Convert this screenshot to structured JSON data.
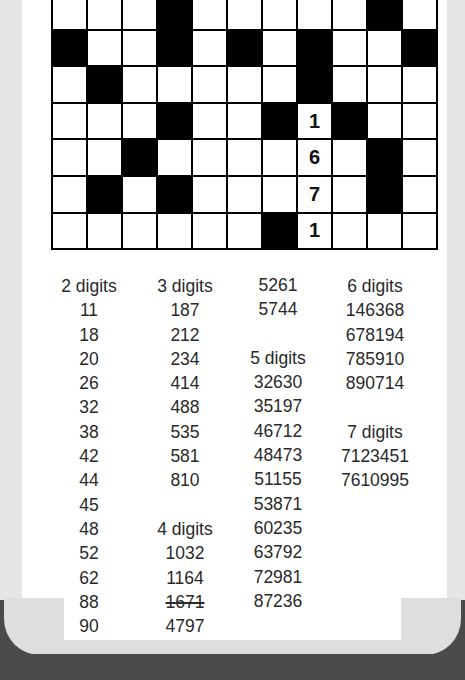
{
  "grid": {
    "cols": 11,
    "rows": 7,
    "cells": [
      [
        "w",
        "w",
        "w",
        "b",
        "w",
        "w",
        "w",
        "w",
        "w",
        "b",
        "w"
      ],
      [
        "b",
        "w",
        "w",
        "b",
        "w",
        "b",
        "w",
        "b",
        "w",
        "w",
        "b"
      ],
      [
        "w",
        "b",
        "w",
        "w",
        "w",
        "w",
        "w",
        "b",
        "w",
        "w",
        "w"
      ],
      [
        "w",
        "w",
        "w",
        "b",
        "w",
        "w",
        "b",
        "1",
        "b",
        "w",
        "w"
      ],
      [
        "w",
        "w",
        "b",
        "w",
        "w",
        "w",
        "w",
        "6",
        "w",
        "b",
        "w"
      ],
      [
        "w",
        "b",
        "w",
        "b",
        "w",
        "w",
        "w",
        "7",
        "w",
        "b",
        "w"
      ],
      [
        "w",
        "w",
        "w",
        "w",
        "w",
        "w",
        "b",
        "1",
        "w",
        "w",
        "w"
      ]
    ]
  },
  "lists": {
    "col1": [
      {
        "text": "2 digits",
        "type": "heading"
      },
      {
        "text": "11"
      },
      {
        "text": "18"
      },
      {
        "text": "20"
      },
      {
        "text": "26"
      },
      {
        "text": "32"
      },
      {
        "text": "38"
      },
      {
        "text": "42"
      },
      {
        "text": "44"
      },
      {
        "text": "45"
      },
      {
        "text": "48"
      },
      {
        "text": "52"
      },
      {
        "text": "62"
      },
      {
        "text": "88"
      },
      {
        "text": "90"
      }
    ],
    "col2": [
      {
        "text": "3 digits",
        "type": "heading"
      },
      {
        "text": "187"
      },
      {
        "text": "212"
      },
      {
        "text": "234"
      },
      {
        "text": "414"
      },
      {
        "text": "488"
      },
      {
        "text": "535"
      },
      {
        "text": "581"
      },
      {
        "text": "810"
      },
      {
        "text": ""
      },
      {
        "text": "4 digits",
        "type": "heading"
      },
      {
        "text": "1032"
      },
      {
        "text": "1164"
      },
      {
        "text": "1671",
        "struck": true
      },
      {
        "text": "4797"
      }
    ],
    "col3": [
      {
        "text": "5261"
      },
      {
        "text": "5744"
      },
      {
        "text": ""
      },
      {
        "text": "5 digits",
        "type": "heading"
      },
      {
        "text": "32630"
      },
      {
        "text": "35197"
      },
      {
        "text": "46712"
      },
      {
        "text": "48473"
      },
      {
        "text": "51155"
      },
      {
        "text": "53871"
      },
      {
        "text": "60235"
      },
      {
        "text": "63792"
      },
      {
        "text": "72981"
      },
      {
        "text": "87236"
      }
    ],
    "col4": [
      {
        "text": "6 digits",
        "type": "heading"
      },
      {
        "text": "146368"
      },
      {
        "text": "678194"
      },
      {
        "text": "785910"
      },
      {
        "text": "890714"
      },
      {
        "text": ""
      },
      {
        "text": "7 digits",
        "type": "heading"
      },
      {
        "text": "7123451"
      },
      {
        "text": "7610995"
      }
    ]
  },
  "colors": {
    "page": "#ffffff",
    "margin": "#e6e6e6",
    "base": "#4b4b4b",
    "black_cell": "#000000",
    "text": "#2a2a2a"
  }
}
